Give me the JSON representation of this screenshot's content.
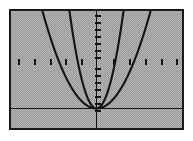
{
  "figure": {
    "kind": "graphing-calculator-plot",
    "background_color": "#b4b4b4",
    "frame_color": "#1a1a1a",
    "curve_color": "#141414",
    "axis_color": "#141414",
    "outer_margin_color": "#ffffff"
  },
  "chart_data": {
    "type": "line",
    "title": "",
    "subtitle": "",
    "xlabel": "",
    "ylabel": "",
    "grid": false,
    "legend": null,
    "legend_position": "none",
    "axis_style": "centered-crosshair-with-tick-marks",
    "xlim": [
      -10,
      10
    ],
    "ylim": [
      -2,
      10
    ],
    "x_axis_at_y": 0,
    "y_axis_at_x": 0,
    "x_tick_count": 20,
    "y_tick_count": 12,
    "x_tick_labels": [],
    "y_tick_labels": [],
    "annotations": [],
    "series": [
      {
        "name": "narrow parabola",
        "equation": "y = x^2",
        "type": "parabola",
        "opens": "up",
        "vertex": [
          0,
          0
        ],
        "leading_coefficient": 1,
        "x": [
          -3.1,
          -2.8,
          -2.4,
          -2.0,
          -1.6,
          -1.2,
          -0.8,
          -0.4,
          0,
          0.4,
          0.8,
          1.2,
          1.6,
          2.0,
          2.4,
          2.8,
          3.1
        ],
        "values": [
          9.61,
          7.84,
          5.76,
          4.0,
          2.56,
          1.44,
          0.64,
          0.16,
          0,
          0.16,
          0.64,
          1.44,
          2.56,
          4.0,
          5.76,
          7.84,
          9.61
        ]
      },
      {
        "name": "wide parabola",
        "equation": "y = 0.25x^2",
        "type": "parabola",
        "opens": "up",
        "vertex": [
          0,
          0
        ],
        "leading_coefficient": 0.25,
        "x": [
          -6.2,
          -5.6,
          -4.8,
          -4.0,
          -3.2,
          -2.4,
          -1.6,
          -0.8,
          0,
          0.8,
          1.6,
          2.4,
          3.2,
          4.0,
          4.8,
          5.6,
          6.2
        ],
        "values": [
          9.61,
          7.84,
          5.76,
          4.0,
          2.56,
          1.44,
          0.64,
          0.16,
          0,
          0.16,
          0.64,
          1.44,
          2.56,
          4.0,
          5.76,
          7.84,
          9.61
        ]
      }
    ]
  }
}
